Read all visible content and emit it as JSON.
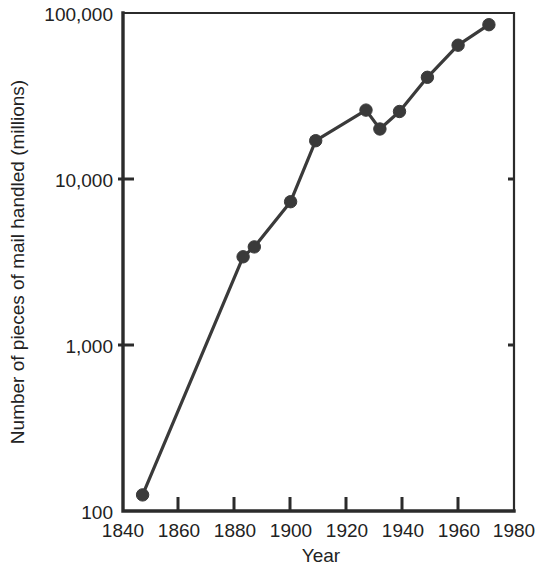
{
  "chart_data": {
    "type": "line",
    "title": "",
    "xlabel": "Year",
    "ylabel": "Number of pieces of mail handled (millions)",
    "yscale": "log",
    "xscale": "linear",
    "xlim": [
      1840,
      1980
    ],
    "ylim": [
      100,
      100000
    ],
    "grid": false,
    "legend": null,
    "x_ticks": [
      1840,
      1860,
      1880,
      1900,
      1920,
      1940,
      1960,
      1980
    ],
    "x_tick_labels": [
      "1840",
      "1860",
      "1880",
      "1900",
      "1920",
      "1940",
      "1960",
      "1980"
    ],
    "y_ticks": [
      100,
      1000,
      10000,
      100000
    ],
    "y_tick_labels": [
      "100",
      "1,000",
      "10,000",
      "100,000"
    ],
    "marker": "circle",
    "marker_color": "#3a3a3a",
    "line_color": "#3a3a3a",
    "x": [
      1847,
      1883,
      1887,
      1900,
      1909,
      1927,
      1932,
      1939,
      1949,
      1960,
      1971
    ],
    "values": [
      125,
      3400,
      3900,
      7300,
      17000,
      26000,
      20000,
      25500,
      41000,
      64000,
      85000
    ],
    "points": [
      {
        "year": 1847,
        "value": 125
      },
      {
        "year": 1883,
        "value": 3400
      },
      {
        "year": 1887,
        "value": 3900
      },
      {
        "year": 1900,
        "value": 7300
      },
      {
        "year": 1909,
        "value": 17000
      },
      {
        "year": 1927,
        "value": 26000
      },
      {
        "year": 1932,
        "value": 20000
      },
      {
        "year": 1939,
        "value": 25500
      },
      {
        "year": 1949,
        "value": 41000
      },
      {
        "year": 1960,
        "value": 64000
      },
      {
        "year": 1971,
        "value": 85000
      }
    ]
  },
  "axes": {
    "y_label": "Number of pieces of mail handled (millions)",
    "x_label": "Year",
    "y_tick_labels": [
      "100,000",
      "10,000",
      "1,000",
      "100"
    ],
    "x_tick_labels": [
      "1840",
      "1860",
      "1880",
      "1900",
      "1920",
      "1940",
      "1960",
      "1980"
    ]
  },
  "style": {
    "ink_color": "#2b2b2b",
    "marker_color": "#3a3a3a",
    "background": "#ffffff"
  }
}
